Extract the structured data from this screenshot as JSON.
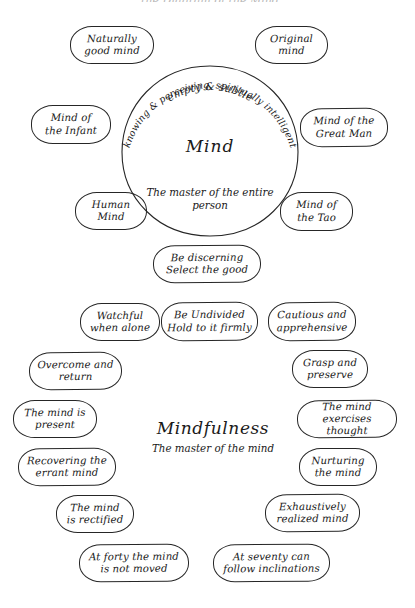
{
  "page": {
    "title": "Mind",
    "cut_off_header": "the Diagram of the Mind"
  },
  "mind_circle": {
    "arc_outer": "empty & subtle",
    "arc_inner": "knowing & perceiving, spiritually intelligent",
    "center_word": "Mind",
    "center_subtitle_line1": "The master of",
    "center_subtitle_line2": "the entire person"
  },
  "mind_nodes": [
    {
      "id": "naturally-good-mind",
      "line1": "Naturally",
      "line2": "good mind"
    },
    {
      "id": "original-mind",
      "line1": "Original",
      "line2": "mind"
    },
    {
      "id": "mind-of-the-infant",
      "line1": "Mind of",
      "line2": "the Infant"
    },
    {
      "id": "mind-of-the-great-man",
      "line1": "Mind of the",
      "line2": "Great Man"
    },
    {
      "id": "human-mind",
      "line1": "Human",
      "line2": "Mind"
    },
    {
      "id": "mind-of-the-tao",
      "line1": "Mind of",
      "line2": "the Tao"
    }
  ],
  "bridge_node": {
    "id": "be-discerning",
    "line1": "Be discerning",
    "line2": "Select the good"
  },
  "mindfulness_center": {
    "word": "Mindfulness",
    "subtitle": "The master of the mind"
  },
  "mindfulness_nodes": [
    {
      "id": "watchful-when-alone",
      "line1": "Watchful",
      "line2": "when alone"
    },
    {
      "id": "be-undivided",
      "line1": "Be Undivided",
      "line2": "Hold to it firmly"
    },
    {
      "id": "cautious-and-apprehensive",
      "line1": "Cautious and",
      "line2": "apprehensive"
    },
    {
      "id": "overcome-and-return",
      "line1": "Overcome and",
      "line2": "return"
    },
    {
      "id": "grasp-and-preserve",
      "line1": "Grasp and",
      "line2": "preserve"
    },
    {
      "id": "the-mind-is-present",
      "line1": "The mind is",
      "line2": "present"
    },
    {
      "id": "the-mind-exercises-thought",
      "line1": "The mind",
      "line2": "exercises thought"
    },
    {
      "id": "recovering-the-errant-mind",
      "line1": "Recovering the",
      "line2": "errant mind"
    },
    {
      "id": "nurturing-the-mind",
      "line1": "Nurturing",
      "line2": "the mind"
    },
    {
      "id": "the-mind-is-rectified",
      "line1": "The mind",
      "line2": "is rectified"
    },
    {
      "id": "exhaustively-realized-mind",
      "line1": "Exhaustively",
      "line2": "realized mind"
    },
    {
      "id": "at-forty-the-mind-is-not-moved",
      "line1": "At forty the mind",
      "line2": "is not moved"
    },
    {
      "id": "at-seventy-can-follow-inclinations",
      "line1": "At seventy can",
      "line2": "follow inclinations"
    }
  ],
  "style": {
    "ink_color": "#1a1a1a",
    "paper_color": "#ffffff"
  }
}
